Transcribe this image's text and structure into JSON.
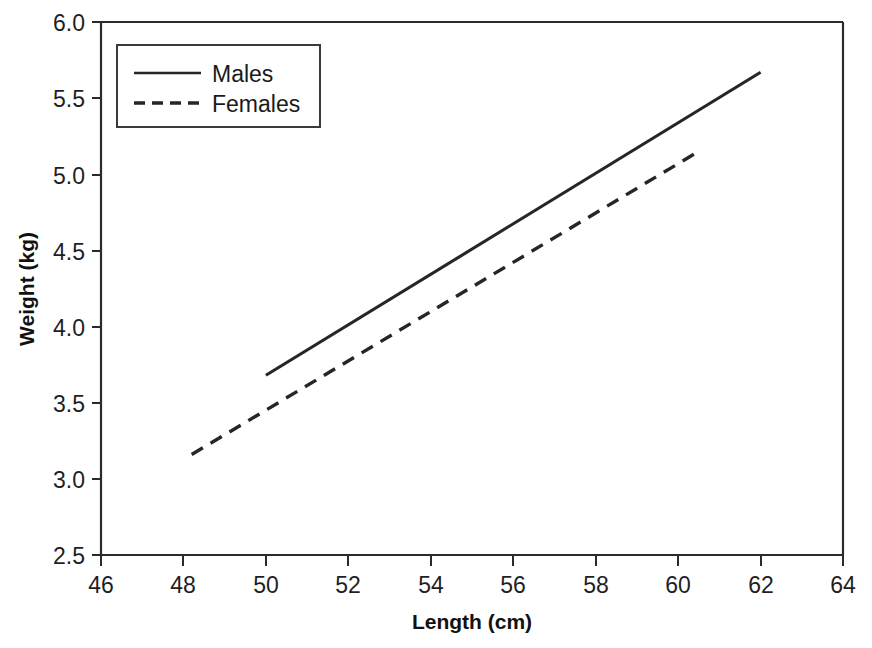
{
  "chart_data": {
    "type": "line",
    "title": "",
    "xlabel": "Length (cm)",
    "ylabel": "Weight (kg)",
    "xlim": [
      46,
      64
    ],
    "ylim": [
      2.5,
      6.0
    ],
    "xticks": [
      46,
      48,
      50,
      52,
      54,
      56,
      58,
      60,
      62,
      64
    ],
    "xticklabels": [
      "46",
      "48",
      "50",
      "52",
      "54",
      "56",
      "58",
      "60",
      "62",
      "64"
    ],
    "yticks": [
      2.5,
      3.0,
      3.5,
      4.0,
      4.5,
      5.0,
      5.5,
      6.0
    ],
    "yticklabels": [
      "2.5",
      "3.0",
      "3.5",
      "4.0",
      "4.5",
      "5.0",
      "5.5",
      "6.0"
    ],
    "grid": false,
    "legend_position": "upper-left-inside",
    "series": [
      {
        "name": "Males",
        "style": "solid",
        "color": "#262626",
        "x": [
          50.0,
          62.0
        ],
        "y": [
          3.68,
          5.67
        ]
      },
      {
        "name": "Females",
        "style": "dashed",
        "color": "#262626",
        "x": [
          48.2,
          60.5
        ],
        "y": [
          3.16,
          5.15
        ]
      }
    ]
  },
  "legend": {
    "entries": [
      {
        "label": "Males",
        "style": "solid"
      },
      {
        "label": "Females",
        "style": "dashed"
      }
    ]
  }
}
